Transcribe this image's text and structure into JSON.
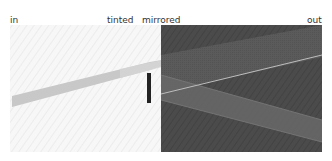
{
  "labels": {
    "in": "in",
    "tinted": "tinted",
    "mirrored": "mirrored",
    "out": "out"
  },
  "colors": {
    "background": "#ffffff",
    "input_panel": "#f4f4f4",
    "output_panel": "#4a4a4a",
    "beam_in": "#c8c8c8",
    "mirror_bar": "#222222",
    "band_upper": "#5c5c5c",
    "band_reflected": "#6a6a6a",
    "thin_line": "#bdbdbd"
  }
}
